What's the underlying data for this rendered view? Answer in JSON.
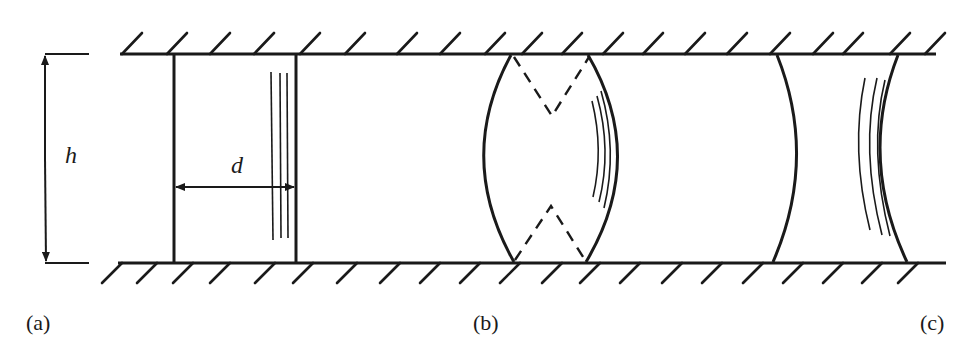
{
  "figure": {
    "ink_color": "#1a1a1a",
    "background": "#ffffff",
    "channel": {
      "top_wall_y": 54,
      "bottom_wall_y": 263,
      "top_wall_x": [
        120,
        936
      ],
      "bottom_wall_x": [
        118,
        946
      ],
      "top_hatch_x": [
        122,
        167,
        210,
        254,
        300,
        345,
        397,
        440,
        485,
        522,
        562,
        603,
        643,
        685,
        727,
        770,
        813,
        843,
        890,
        925
      ],
      "bottom_hatch_x": [
        122,
        157,
        193,
        230,
        275,
        313,
        357,
        400,
        440,
        480,
        520,
        562,
        600,
        640,
        682,
        722,
        763,
        803,
        843,
        882,
        918
      ]
    },
    "labels": {
      "height": "h",
      "distance": "d",
      "panel_a": "(a)",
      "panel_b": "(b)",
      "panel_c": "(c)"
    },
    "panels": [
      {
        "id": "a",
        "shape": "flat slug",
        "left_x": 174,
        "right_x": 296
      },
      {
        "id": "b",
        "shape": "convex (biconvex) slug with dashed contact-angle lines",
        "left_x": 512,
        "right_x": 587
      },
      {
        "id": "c",
        "shape": "concave (biconcave) slug",
        "left_x": 775,
        "right_x": 903
      }
    ]
  }
}
